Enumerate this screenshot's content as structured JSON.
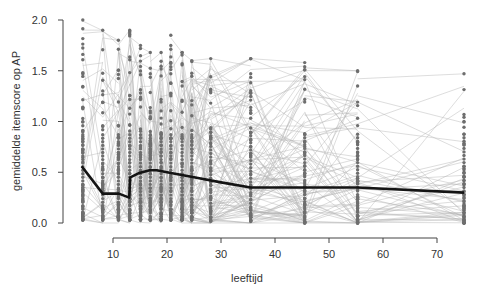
{
  "chart_data": {
    "type": "line",
    "subtype": "spaghetti-plot-with-mean-line",
    "title": "",
    "xlabel": "leeftijd",
    "ylabel": "gemiddelde itemscore op AP",
    "xlim": [
      3,
      76
    ],
    "ylim": [
      0,
      2.0
    ],
    "x_ticks": [
      10,
      20,
      30,
      40,
      50,
      60,
      70
    ],
    "x_tick_labels": [
      "10",
      "20",
      "30",
      "40",
      "50",
      "60",
      "70"
    ],
    "y_ticks": [
      0.0,
      0.5,
      1.0,
      1.5,
      2.0
    ],
    "y_tick_labels": [
      "0.0",
      "0.5",
      "1.0",
      "1.5",
      "2.0"
    ],
    "grid": false,
    "legend": null,
    "measurement_ages": [
      4.4,
      8.1,
      11.0,
      13.1,
      15.1,
      16.9,
      18.9,
      20.7,
      22.8,
      24.6,
      28.1,
      35.5,
      45.5,
      55.3,
      75.0
    ],
    "column_max": [
      2.0,
      1.9,
      1.8,
      1.9,
      1.75,
      1.68,
      1.68,
      1.85,
      1.68,
      1.6,
      1.62,
      1.62,
      1.58,
      1.5,
      1.47
    ],
    "column_min": [
      0.03,
      0.03,
      0.03,
      0.03,
      0.03,
      0.03,
      0.03,
      0.03,
      0.03,
      0.03,
      0.02,
      0.02,
      0.0,
      0.0,
      0.0
    ],
    "column_density": [
      60,
      40,
      40,
      40,
      40,
      40,
      40,
      40,
      40,
      34,
      28,
      40,
      40,
      40,
      40
    ],
    "mean_line": {
      "name": "gemiddelde",
      "x": [
        4.2,
        8.1,
        11.1,
        13.0,
        13.2,
        14.7,
        16.8,
        18.1,
        20.0,
        25.0,
        30.0,
        35.5,
        45.5,
        55.3,
        75.0
      ],
      "y": [
        0.56,
        0.29,
        0.29,
        0.25,
        0.45,
        0.49,
        0.52,
        0.52,
        0.5,
        0.45,
        0.4,
        0.35,
        0.35,
        0.35,
        0.3
      ]
    },
    "individual_series_count": 400,
    "colors": {
      "individual_lines": "#b4b4b4",
      "points": "#6e6e6e",
      "mean_line": "#141414",
      "axes": "#444444"
    }
  }
}
